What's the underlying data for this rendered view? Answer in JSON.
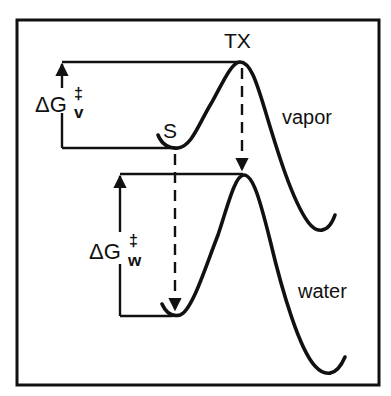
{
  "diagram": {
    "type": "reaction free-energy profile",
    "labels": {
      "transition_state": "TX",
      "substrate": "S",
      "vapor_phase": "vapor",
      "water_phase": "water",
      "delta_g": "ΔG",
      "double_dagger": "‡",
      "vapor_subscript": "v",
      "water_subscript": "w"
    },
    "curves": [
      {
        "name": "vapor",
        "minimum": "S",
        "maximum": "TX",
        "barrier": "ΔG‡v"
      },
      {
        "name": "water",
        "minimum": "S",
        "maximum": "TX",
        "barrier": "ΔG‡w"
      }
    ],
    "annotations": [
      "dashed arrow from S (vapor) down to S (water)",
      "dashed arrow from TX (vapor) down to TX (water)"
    ],
    "colors": {
      "ink": "#111111",
      "background": "#ffffff"
    }
  }
}
